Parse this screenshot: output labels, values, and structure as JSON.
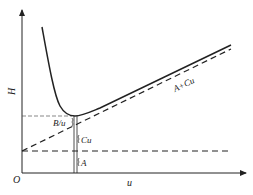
{
  "diagram": {
    "type": "van-deemter-plot",
    "axes": {
      "x_label": "u",
      "y_label": "H",
      "origin_label": "O"
    },
    "curves": [
      {
        "name": "H-curve",
        "style": "solid",
        "description": "H = A + B/u + Cu"
      },
      {
        "name": "A+Cu line",
        "style": "dashed",
        "label": "A+Cu"
      },
      {
        "name": "A level",
        "style": "dashed"
      },
      {
        "name": "H-min level",
        "style": "dashed"
      }
    ],
    "annotations": {
      "b_over_u": "B/u",
      "cu": "Cu",
      "a": "A",
      "a_plus_cu": "A+Cu"
    },
    "colors": {
      "line": "#222222",
      "background": "#ffffff"
    }
  }
}
